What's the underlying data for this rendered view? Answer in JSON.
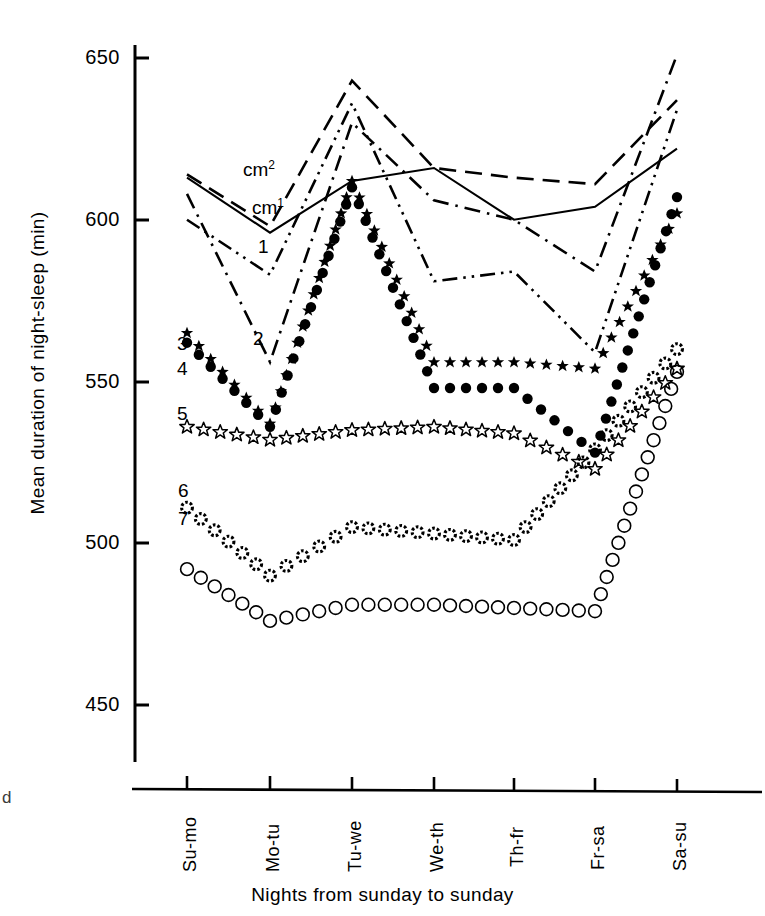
{
  "axes": {
    "ylabel": "Mean duration of night-sleep (min)",
    "xlabel": "Nights from sunday to sunday",
    "yticks": [
      "650",
      "600",
      "550",
      "500",
      "450"
    ],
    "xticks": [
      "Su-mo",
      "Mo-tu",
      "Tu-we",
      "We-th",
      "Th-fr",
      "Fr-sa",
      "Sa-su"
    ]
  },
  "edge_artifact": "d",
  "labels": {
    "cm2": "cm",
    "cm2_sup": "2",
    "cm1": "cm",
    "cm1_sup": "1",
    "one": "1",
    "two": "2",
    "three": "3",
    "four": "4",
    "five": "5",
    "six": "6",
    "seven": "7"
  },
  "colors": {
    "ink": "#000000",
    "background": "#ffffff"
  },
  "chart_data": {
    "type": "line",
    "title": "",
    "xlabel": "Nights from sunday to sunday",
    "ylabel": "Mean duration of night-sleep (min)",
    "ylim": [
      440,
      655
    ],
    "yticks": [
      450,
      500,
      550,
      600,
      650
    ],
    "grid": false,
    "legend": "inline-labels",
    "categories": [
      "Su-mo",
      "Mo-tu",
      "Tu-we",
      "We-th",
      "Th-fr",
      "Fr-sa",
      "Sa-su"
    ],
    "series": [
      {
        "name": "cm2",
        "label": "cm²",
        "style": "dashed",
        "marker": "none",
        "values": [
          614,
          598,
          643,
          616,
          613,
          611,
          637
        ]
      },
      {
        "name": "cm1",
        "label": "cm¹",
        "style": "solid",
        "marker": "none",
        "values": [
          613,
          596,
          612,
          616,
          600,
          604,
          622
        ]
      },
      {
        "name": "1",
        "label": "1",
        "style": "dash-dot",
        "marker": "none",
        "values": [
          608,
          556,
          630,
          606,
          600,
          584,
          651
        ]
      },
      {
        "name": "2",
        "label": "2",
        "style": "dash-dot-dot",
        "marker": "none",
        "values": [
          600,
          583,
          636,
          581,
          584,
          559,
          634
        ]
      },
      {
        "name": "3",
        "label": "3",
        "style": "dotted-markers",
        "marker": "star-5-filled",
        "values": [
          565,
          537,
          612,
          556,
          556,
          554,
          602
        ]
      },
      {
        "name": "4",
        "label": "4",
        "style": "dotted-markers",
        "marker": "circle-filled",
        "values": [
          562,
          536,
          610,
          548,
          548,
          528,
          607
        ]
      },
      {
        "name": "5",
        "label": "5",
        "style": "dotted-markers",
        "marker": "star-5-open",
        "values": [
          536,
          532,
          535,
          536,
          534,
          523,
          554
        ]
      },
      {
        "name": "6",
        "label": "6",
        "style": "dotted-markers",
        "marker": "circle-dotted",
        "values": [
          511,
          490,
          505,
          503,
          501,
          529,
          560
        ]
      },
      {
        "name": "7",
        "label": "7",
        "style": "dotted-markers",
        "marker": "circle-open",
        "values": [
          492,
          476,
          481,
          481,
          480,
          479,
          553
        ]
      }
    ]
  }
}
